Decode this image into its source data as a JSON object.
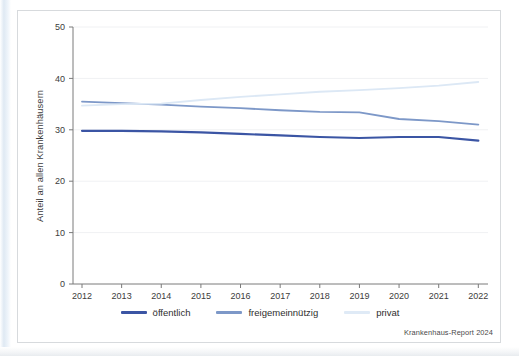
{
  "figure": {
    "source_note": "Krankenhaus-Report 2024"
  },
  "chart_data": {
    "type": "line",
    "title": "",
    "xlabel": "",
    "ylabel": "Anteil an allen Krankenhäusern",
    "categories": [
      "2012",
      "2013",
      "2014",
      "2015",
      "2016",
      "2017",
      "2018",
      "2019",
      "2020",
      "2021",
      "2022"
    ],
    "xtick_labels": [
      "2012",
      "2013",
      "2014",
      "2015",
      "2016",
      "2017",
      "2018",
      "2019",
      "2020",
      "2021",
      "2022"
    ],
    "ytick_labels": [
      "0",
      "10",
      "20",
      "30",
      "40",
      "50"
    ],
    "yticks": [
      0,
      10,
      20,
      30,
      40,
      50
    ],
    "ylim": [
      0,
      50
    ],
    "grid": "horizontal",
    "legend_position": "bottom-center",
    "series": [
      {
        "name": "öffentlich",
        "color": "#3b55a4",
        "width": 2.2,
        "values": [
          29.8,
          29.8,
          29.7,
          29.5,
          29.2,
          28.9,
          28.6,
          28.4,
          28.6,
          28.6,
          27.9
        ]
      },
      {
        "name": "freigemeinnützig",
        "color": "#7d98c8",
        "width": 1.8,
        "values": [
          35.5,
          35.2,
          34.9,
          34.5,
          34.2,
          33.8,
          33.5,
          33.4,
          32.1,
          31.7,
          31.0
        ]
      },
      {
        "name": "privat",
        "color": "#dce8f5",
        "width": 1.8,
        "values": [
          34.7,
          35.0,
          35.1,
          35.8,
          36.4,
          36.9,
          37.4,
          37.7,
          38.1,
          38.6,
          39.3
        ]
      }
    ]
  },
  "legend": {
    "items": [
      {
        "label": "öffentlich",
        "color": "#3b55a4"
      },
      {
        "label": "freigemeinnützig",
        "color": "#7d98c8"
      },
      {
        "label": "privat",
        "color": "#dfeaf6"
      }
    ]
  }
}
